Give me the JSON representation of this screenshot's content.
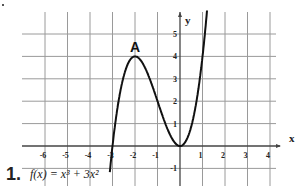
{
  "problem": {
    "number": "1.",
    "formula": "f(x) = x³ + 3x²"
  },
  "chart_data": {
    "type": "line",
    "title": "",
    "function": "f(x) = x^3 + 3x^2",
    "xlabel": "x",
    "ylabel": "y",
    "x_ticks": [
      -6,
      -5,
      -4,
      -3,
      -2,
      -1,
      1,
      2,
      3,
      4
    ],
    "y_ticks": [
      -1,
      1,
      2,
      3,
      4,
      5
    ],
    "xlim": [
      -7,
      5
    ],
    "ylim": [
      -1.5,
      6
    ],
    "grid": true,
    "series": [
      {
        "name": "f(x)",
        "x": [
          -3.1,
          -3,
          -2.5,
          -2,
          -1.5,
          -1,
          -0.5,
          0,
          0.5,
          1,
          1.2
        ],
        "values": [
          -0.93,
          0,
          3.125,
          4,
          3.375,
          2,
          0.625,
          0,
          0.875,
          4,
          6.05
        ]
      }
    ],
    "annotations": [
      {
        "text": "A",
        "x": -2,
        "y": 4
      }
    ]
  },
  "colors": {
    "grid": "#9a9a9a",
    "curve": "#111111",
    "text": "#222222"
  }
}
